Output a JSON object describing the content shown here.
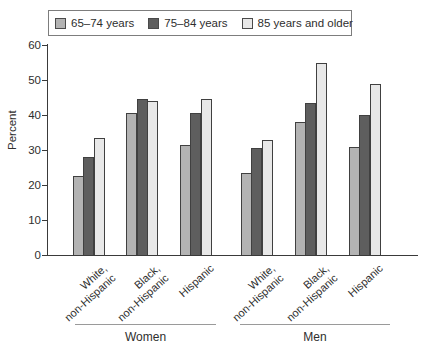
{
  "chart_data": {
    "type": "bar",
    "title": "",
    "ylabel": "Percent",
    "xlabel": "",
    "ylim": [
      0,
      60
    ],
    "yticks": [
      0,
      10,
      20,
      30,
      40,
      50,
      60
    ],
    "grid": false,
    "legend_position": "top",
    "series": [
      {
        "name": "65–74 years",
        "color": "#b3b3b3",
        "values": [
          22.5,
          40.5,
          31.5,
          23.5,
          38.0,
          31.0
        ]
      },
      {
        "name": "75–84 years",
        "color": "#5e5e5e",
        "values": [
          28.0,
          44.5,
          40.5,
          30.5,
          43.5,
          40.0
        ]
      },
      {
        "name": "85 years and older",
        "color": "#e8e8e8",
        "values": [
          33.5,
          44.0,
          44.5,
          33.0,
          55.0,
          49.0
        ]
      }
    ],
    "categories": [
      "White,\nnon-Hispanic",
      "Black,\nnon-Hispanic",
      "Hispanic",
      "White,\nnon-Hispanic",
      "Black,\nnon-Hispanic",
      "Hispanic"
    ],
    "groups": [
      {
        "label": "Women",
        "category_indexes": [
          0,
          1,
          2
        ]
      },
      {
        "label": "Men",
        "category_indexes": [
          3,
          4,
          5
        ]
      }
    ]
  },
  "colors": {
    "axis": "#3a3a3a",
    "bar_border": "#404040",
    "legend_border": "#7d7d7d",
    "group_line": "#9a9a9a",
    "text": "#2e2e2e",
    "background": "#ffffff"
  }
}
